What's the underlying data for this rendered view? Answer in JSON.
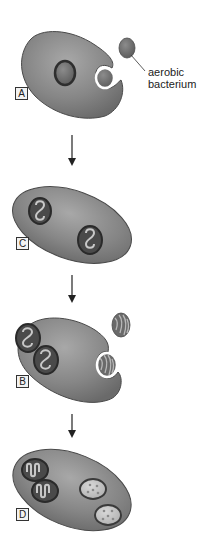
{
  "diagram": {
    "callout": {
      "line1": "aerobic",
      "line2": "bacterium"
    },
    "stages": [
      {
        "label": "A",
        "description": "Host cell engulfing aerobic bacterium; nucleus-like organelle present"
      },
      {
        "label": "C",
        "description": "Host cell containing two mitochondria"
      },
      {
        "label": "B",
        "description": "Host cell with two mitochondria engulfing photosynthetic bacterium"
      },
      {
        "label": "D",
        "description": "Host cell containing two mitochondria and two chloroplasts"
      }
    ],
    "colors": {
      "cell_fill": "#8a8a8a",
      "cell_stroke": "#4a4a4a",
      "organelle_dark": "#3a3a3a",
      "organelle_fill": "#6e6e6e",
      "chloroplast_fill": "#c8c8c8",
      "background": "#ffffff"
    }
  }
}
